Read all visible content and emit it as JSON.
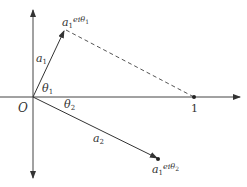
{
  "diagram": {
    "type": "complex-plane-vector-diagram",
    "origin_label": "O",
    "unit_point_label": "1",
    "points": {
      "p1": {
        "label_base": "a",
        "label_sub": "1",
        "label_exp": "eiθ",
        "label_exp_sub": "1"
      },
      "p2": {
        "label_base": "a",
        "label_sub": "1",
        "label_exp": "eiθ",
        "label_exp_sub": "2"
      }
    },
    "vectors": [
      {
        "id": "v1",
        "label_base": "a",
        "label_sub": "1"
      },
      {
        "id": "v2",
        "label_base": "a",
        "label_sub": "2"
      }
    ],
    "angles": [
      {
        "id": "theta1",
        "label_base": "θ",
        "label_sub": "1"
      },
      {
        "id": "theta2",
        "label_base": "θ",
        "label_sub": "2"
      }
    ],
    "colors": {
      "line": "#333333",
      "dashed": "#555555"
    }
  }
}
